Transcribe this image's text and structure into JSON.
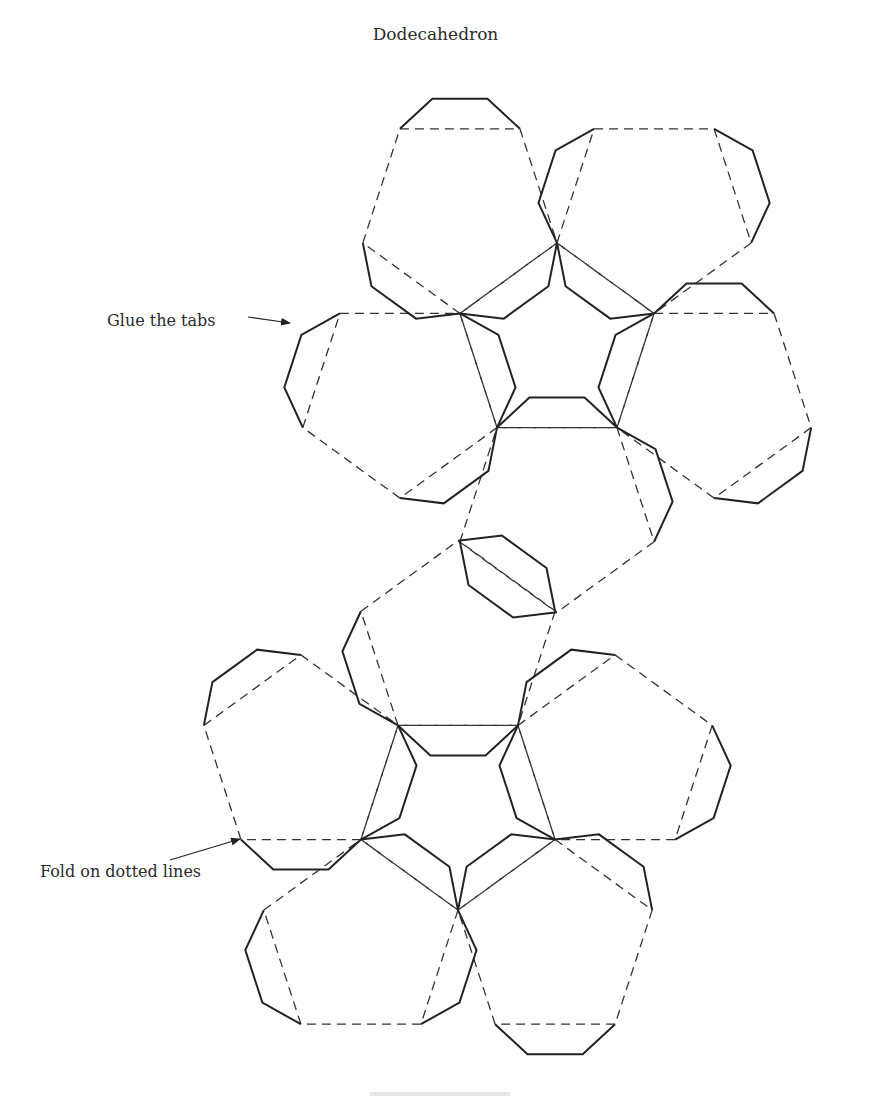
{
  "figure": {
    "title": "Dodecahedron",
    "callouts": {
      "glue": "Glue the tabs",
      "fold": "Fold on dotted lines"
    },
    "colors": {
      "line": "#222222",
      "background": "#ffffff"
    },
    "net": {
      "side": 120,
      "upper_center": {
        "cx": 557,
        "cy": 345,
        "rotation_deg": -90
      },
      "lower_center": {
        "cx": 458,
        "cy": 808,
        "rotation_deg": 90
      }
    },
    "caption_partial": ""
  }
}
